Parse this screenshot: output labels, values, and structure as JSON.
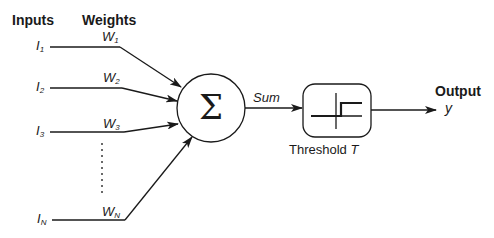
{
  "diagram": {
    "type": "perceptron",
    "headers": {
      "inputs": "Inputs",
      "weights": "Weights",
      "output": "Output"
    },
    "inputs": [
      {
        "label": "I",
        "sub": "1",
        "weight": "W",
        "weight_sub": "1"
      },
      {
        "label": "I",
        "sub": "2",
        "weight": "W",
        "weight_sub": "2"
      },
      {
        "label": "I",
        "sub": "3",
        "weight": "W",
        "weight_sub": "3"
      },
      {
        "label": "I",
        "sub": "N",
        "weight": "W",
        "weight_sub": "N"
      }
    ],
    "summation": {
      "symbol": "Σ",
      "output_label": "Sum"
    },
    "threshold": {
      "label": "Threshold",
      "symbol": "T"
    },
    "output": {
      "symbol": "y"
    },
    "colors": {
      "stroke": "#1a1a1a",
      "background": "#ffffff"
    }
  }
}
